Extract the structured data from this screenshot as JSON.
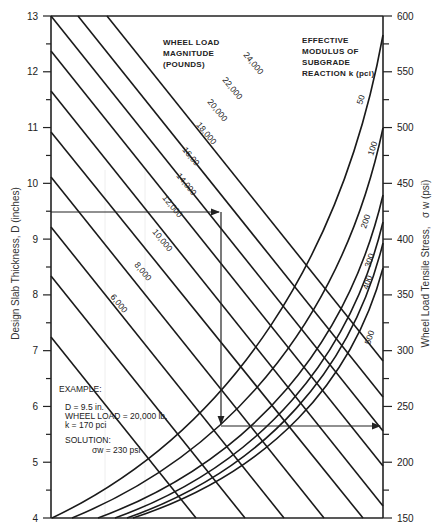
{
  "chart_data": {
    "type": "line",
    "title": "",
    "left_axis": {
      "label": "Design Slab Thickness, D (inches)",
      "range": [
        4,
        13
      ],
      "ticks": [
        4,
        5,
        6,
        7,
        8,
        9,
        10,
        11,
        12,
        13
      ]
    },
    "right_axis": {
      "label": "Wheel Load Tensile Stress,",
      "label_symbol": "σ w (psi)",
      "range": [
        150,
        600
      ],
      "ticks": [
        150,
        200,
        250,
        300,
        350,
        400,
        450,
        500,
        550,
        600
      ]
    },
    "load_header": [
      "WHEEL LOAD",
      "MAGNITUDE",
      "(POUNDS)"
    ],
    "k_header": [
      "EFFECTIVE",
      "MODULUS OF",
      "SUBGRADE",
      "REACTION  k (pci)"
    ],
    "wheel_load_lines": [
      {
        "label": "24,000",
        "start": [
          107,
          16
        ],
        "end": [
          383,
          361
        ]
      },
      {
        "label": "22,000",
        "start": [
          78,
          16
        ],
        "end": [
          383,
          397
        ]
      },
      {
        "label": "20,000",
        "start": [
          51,
          16
        ],
        "end": [
          383,
          431
        ]
      },
      {
        "label": "18,000",
        "start": [
          51,
          51
        ],
        "end": [
          383,
          466
        ]
      },
      {
        "label": "16,00",
        "start": [
          51,
          91
        ],
        "end": [
          383,
          506
        ]
      },
      {
        "label": "14,000",
        "start": [
          51,
          132
        ],
        "end": [
          363,
          518
        ]
      },
      {
        "label": "12,000",
        "start": [
          51,
          177
        ],
        "end": [
          324,
          518
        ]
      },
      {
        "label": "10,000",
        "start": [
          51,
          227
        ],
        "end": [
          284,
          518
        ]
      },
      {
        "label": "8,000",
        "start": [
          51,
          276
        ],
        "end": [
          245,
          518
        ]
      },
      {
        "label": "6,000",
        "start": [
          51,
          337
        ],
        "end": [
          196,
          518
        ]
      }
    ],
    "k_curves": [
      {
        "label": "50",
        "bottom_x": 52,
        "right_y": 35
      },
      {
        "label": "100",
        "bottom_x": 72,
        "right_y": 128
      },
      {
        "label": "200",
        "bottom_x": 98,
        "right_y": 195
      },
      {
        "label": "300",
        "bottom_x": 115,
        "right_y": 222
      },
      {
        "label": "400",
        "bottom_x": 127,
        "right_y": 243
      },
      {
        "label": "500",
        "bottom_x": 133,
        "right_y": 268
      }
    ],
    "example": {
      "title": "EXAMPLE:",
      "line1": "D = 9.5  in.",
      "line2": "WHEEL  LOAD = 20,000 lb.",
      "line3": "k = 170  pci",
      "solution_title": "SOLUTION:",
      "solution": "σw = 230 psi",
      "D": 9.5,
      "wheel_load": 20000,
      "k": 170,
      "stress": 230
    }
  }
}
